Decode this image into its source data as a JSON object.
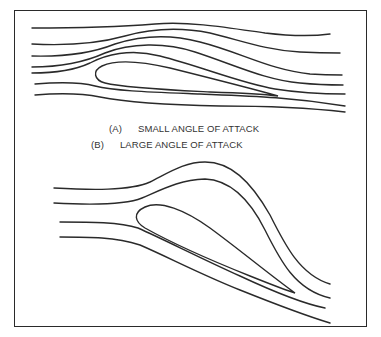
{
  "figure": {
    "captions": [
      {
        "tag": "(A)",
        "label": "SMALL ANGLE OF ATTACK"
      },
      {
        "tag": "(B)",
        "label": "LARGE ANGLE OF ATTACK"
      }
    ],
    "panels": [
      {
        "id": "A",
        "description": "Airfoil at small angle of attack with smooth attached streamlines",
        "streamline_count": 7
      },
      {
        "id": "B",
        "description": "Airfoil at large angle of attack with streamlines deflected sharply upward over upper surface",
        "streamline_count": 4
      }
    ],
    "colors": {
      "line": "#2a2a2a",
      "background": "#ffffff",
      "text": "#333333"
    }
  }
}
